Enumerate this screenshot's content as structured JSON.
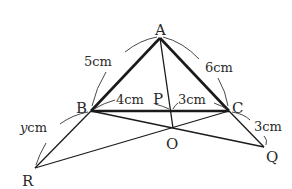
{
  "diagram": {
    "type": "geometry",
    "points": {
      "A": {
        "label": "A",
        "x": 160,
        "y": 38
      },
      "B": {
        "label": "B",
        "x": 91,
        "y": 111
      },
      "C": {
        "label": "C",
        "x": 229,
        "y": 111
      },
      "P": {
        "label": "P",
        "x": 171,
        "y": 111
      },
      "O": {
        "label": "O",
        "x": 173,
        "y": 128
      },
      "Q": {
        "label": "Q",
        "x": 264,
        "y": 147
      },
      "R": {
        "label": "R",
        "x": 35,
        "y": 168
      }
    },
    "thick_segments": [
      [
        "A",
        "B"
      ],
      [
        "A",
        "C"
      ],
      [
        "B",
        "C"
      ]
    ],
    "thin_segments": [
      [
        "A",
        "P"
      ],
      [
        "P",
        "O"
      ],
      [
        "B",
        "R"
      ],
      [
        "R",
        "O"
      ],
      [
        "O",
        "C"
      ],
      [
        "B",
        "O"
      ],
      [
        "O",
        "Q"
      ],
      [
        "C",
        "Q"
      ]
    ],
    "measurements": {
      "AB": "5cm",
      "AC": "6cm",
      "BP": "4cm",
      "PC": "3cm",
      "CQ": "3cm",
      "BR_var": "y",
      "BR_unit": "cm"
    },
    "colors": {
      "line": "#1a1a1a",
      "text": "#2a2a2a",
      "arc": "#333333",
      "background": "#ffffff"
    }
  }
}
